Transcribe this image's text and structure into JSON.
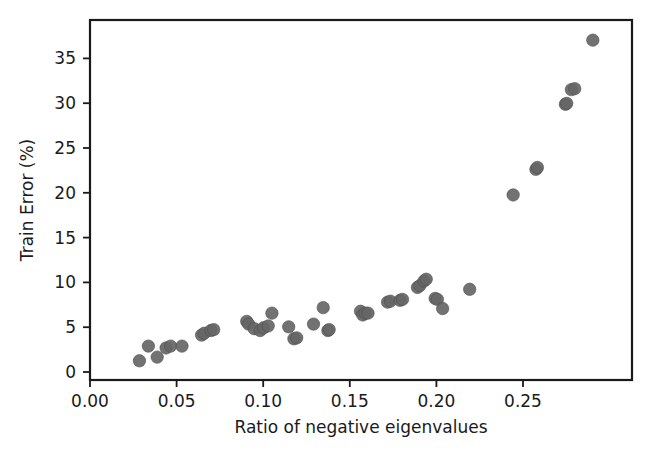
{
  "chart_data": {
    "type": "scatter",
    "title": "",
    "xlabel": "Ratio of negative eigenvalues",
    "ylabel": "Train Error (%)",
    "xlim": [
      -0.005,
      0.2855
    ],
    "ylim": [
      -0.9,
      38.4
    ],
    "grid": false,
    "legend": "none",
    "marker_color": "#666666",
    "axis_color": "#1a1a1a",
    "xticks": [
      0.0,
      0.05,
      0.1,
      0.15,
      0.2,
      0.25
    ],
    "xticklabels": [
      "0.00",
      "0.05",
      "0.10",
      "0.15",
      "0.20",
      "0.25"
    ],
    "yticks": [
      0,
      5,
      10,
      15,
      20,
      25,
      30,
      35
    ],
    "yticklabels": [
      "0",
      "5",
      "10",
      "15",
      "20",
      "25",
      "30",
      "35"
    ],
    "series": [
      {
        "name": "train error vs negative eigenvalue ratio",
        "x": [
          0.0215,
          0.0263,
          0.031,
          0.0358,
          0.0382,
          0.0443,
          0.0548,
          0.0562,
          0.0598,
          0.0613,
          0.079,
          0.08,
          0.083,
          0.0862,
          0.088,
          0.0905,
          0.0925,
          0.1015,
          0.1043,
          0.1058,
          0.1148,
          0.12,
          0.1225,
          0.1232,
          0.14,
          0.1412,
          0.1425,
          0.144,
          0.1545,
          0.156,
          0.1612,
          0.1625,
          0.1705,
          0.1718,
          0.174,
          0.1752,
          0.18,
          0.1812,
          0.184,
          0.1985,
          0.2218,
          0.234,
          0.2348,
          0.2498,
          0.2505,
          0.253,
          0.2548,
          0.2645
        ],
        "y": [
          1.2,
          2.8,
          1.6,
          2.6,
          2.8,
          2.8,
          4.0,
          4.2,
          4.5,
          4.6,
          5.5,
          5.2,
          4.7,
          4.5,
          4.8,
          5.0,
          6.4,
          4.9,
          3.6,
          3.7,
          5.2,
          7.0,
          4.5,
          4.6,
          6.6,
          6.2,
          6.4,
          6.4,
          7.6,
          7.7,
          7.8,
          7.9,
          9.2,
          9.4,
          9.9,
          10.1,
          8.0,
          7.9,
          6.9,
          9.0,
          19.3,
          22.1,
          22.3,
          29.2,
          29.3,
          30.8,
          30.9,
          36.2
        ]
      }
    ]
  },
  "figure": {
    "plot_left": 90,
    "plot_right": 632,
    "plot_top": 20,
    "plot_bottom": 380
  }
}
